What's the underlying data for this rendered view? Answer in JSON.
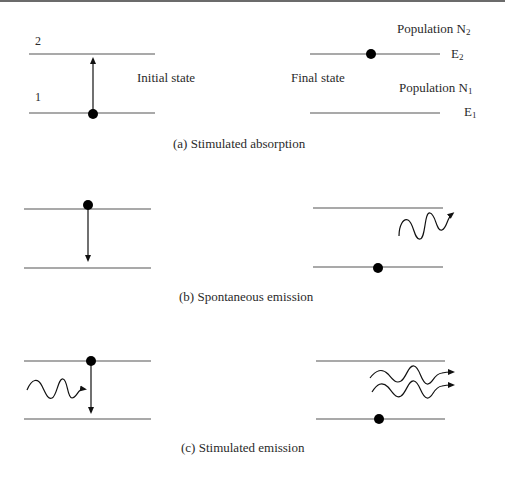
{
  "panels": [
    {
      "id": "a",
      "caption": "(a) Stimulated absorption",
      "left": {
        "level_labels": [
          "2",
          "1"
        ],
        "state_label": "Initial state"
      },
      "right": {
        "state_label": "Final state",
        "population_upper": "Population N",
        "population_upper_sub": "2",
        "population_lower": "Population N",
        "population_lower_sub": "1",
        "energy_upper": "E",
        "energy_upper_sub": "2",
        "energy_lower": "E",
        "energy_lower_sub": "1"
      }
    },
    {
      "id": "b",
      "caption": "(b) Spontaneous emission"
    },
    {
      "id": "c",
      "caption": "(c) Stimulated emission"
    }
  ],
  "colors": {
    "line": "#555555",
    "dot": "#000000",
    "text": "#2a2a2a",
    "top_rule": "#6b6b6b"
  }
}
